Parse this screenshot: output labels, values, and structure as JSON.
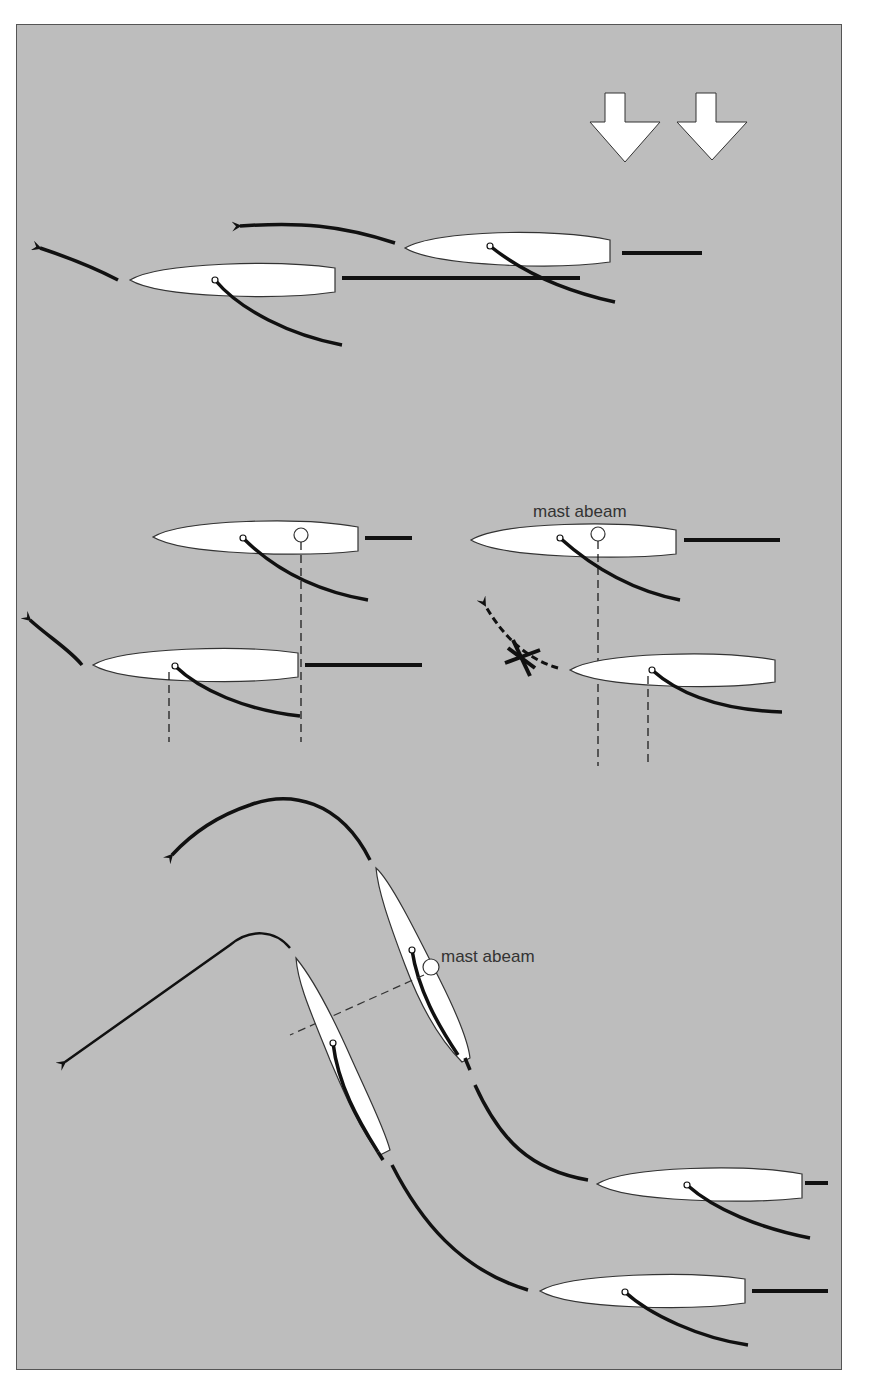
{
  "diagram": {
    "type": "sailing-maneuver-illustration",
    "background_color": "#bdbdbd",
    "hull_color": "#ffffff",
    "line_color": "#111111",
    "wind": {
      "direction": "down",
      "arrow_count": 2
    },
    "labels": {
      "mast_abeam_middle": "mast abeam",
      "mast_abeam_bottom": "mast abeam"
    },
    "sections": [
      {
        "id": "top",
        "boats": 2,
        "description": "overlapping boats sailing left"
      },
      {
        "id": "middle-left",
        "boats": 2,
        "description": "boat clear ahead, windward boat tacks"
      },
      {
        "id": "middle-right",
        "boats": 2,
        "description": "mast abeam, tack not allowed",
        "crossed_path": true
      },
      {
        "id": "bottom",
        "boats": 4,
        "description": "luffing sequence with mast abeam"
      }
    ]
  }
}
